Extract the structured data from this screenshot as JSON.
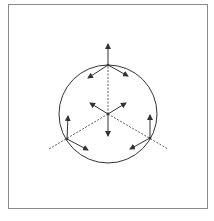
{
  "diagram": {
    "colors": {
      "frame": "#8a8a8a",
      "stroke": "#333333",
      "background": "#ffffff"
    },
    "circle": {
      "cx": 108,
      "cy": 114,
      "r": 49
    },
    "center": {
      "x": 108,
      "y": 114
    },
    "boundary_points": [
      {
        "name": "top",
        "x": 108,
        "y": 65
      },
      {
        "name": "lower-left",
        "x": 67,
        "y": 139
      },
      {
        "name": "lower-right",
        "x": 150,
        "y": 138
      }
    ],
    "dashed_axes": [
      {
        "x1": 108,
        "y1": 114,
        "x2": 108,
        "y2": 65
      },
      {
        "x1": 108,
        "y1": 114,
        "x2": 49,
        "y2": 149
      },
      {
        "x1": 108,
        "y1": 114,
        "x2": 168,
        "y2": 149
      }
    ],
    "arrows": [
      {
        "from": [
          108,
          65
        ],
        "to": [
          108,
          44
        ]
      },
      {
        "from": [
          108,
          65
        ],
        "to": [
          88,
          78
        ]
      },
      {
        "from": [
          108,
          65
        ],
        "to": [
          128,
          76
        ]
      },
      {
        "from": [
          108,
          114
        ],
        "to": [
          90,
          103
        ]
      },
      {
        "from": [
          108,
          114
        ],
        "to": [
          126,
          103
        ]
      },
      {
        "from": [
          108,
          114
        ],
        "to": [
          108,
          136
        ]
      },
      {
        "from": [
          67,
          139
        ],
        "to": [
          68,
          116
        ]
      },
      {
        "from": [
          67,
          139
        ],
        "to": [
          88,
          150
        ]
      },
      {
        "from": [
          150,
          138
        ],
        "to": [
          150,
          115
        ]
      },
      {
        "from": [
          150,
          138
        ],
        "to": [
          130,
          149
        ]
      }
    ]
  }
}
